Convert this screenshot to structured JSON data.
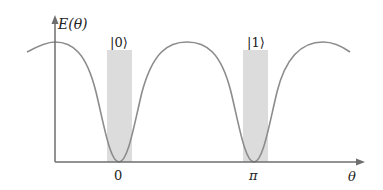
{
  "diagram": {
    "y_axis_label": "E(θ)",
    "x_axis_label": "θ",
    "ticks": [
      {
        "label": "0",
        "position": "theta=0"
      },
      {
        "label": "π",
        "position": "theta=pi"
      }
    ],
    "states": [
      {
        "label": "|0⟩",
        "band_center": "0"
      },
      {
        "label": "|1⟩",
        "band_center": "π"
      }
    ],
    "curve": "energy E(θ) oscillating with minima at θ=0 and θ=π",
    "colors": {
      "curve": "#8c8c8c",
      "axis": "#6e6e6e",
      "band": "#d9d9d9",
      "text": "#222222"
    }
  }
}
